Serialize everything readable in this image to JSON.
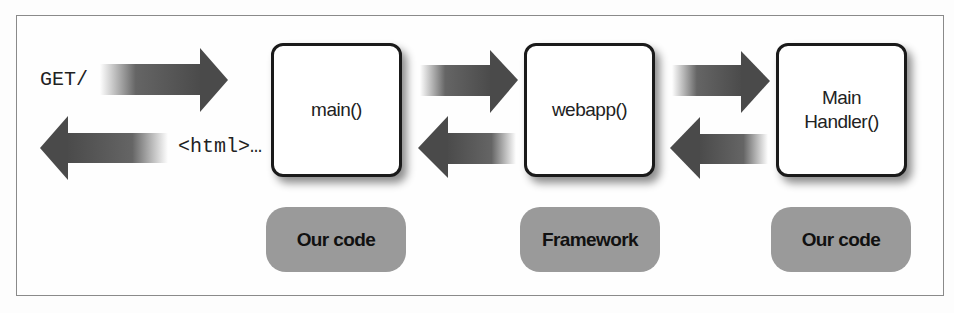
{
  "diagram": {
    "request_label": "GET/",
    "response_label": "<html>…",
    "boxes": [
      {
        "label": "main()"
      },
      {
        "label": "webapp()"
      },
      {
        "label": "Main\nHandler()"
      }
    ],
    "tags": [
      {
        "label": "Our code"
      },
      {
        "label": "Framework"
      },
      {
        "label": "Our code"
      }
    ],
    "colors": {
      "arrow": "#4a4a4a",
      "tag_fill": "#9a9a9a",
      "box_border": "#1a1a1a",
      "frame_border": "#8a8a8a"
    }
  }
}
